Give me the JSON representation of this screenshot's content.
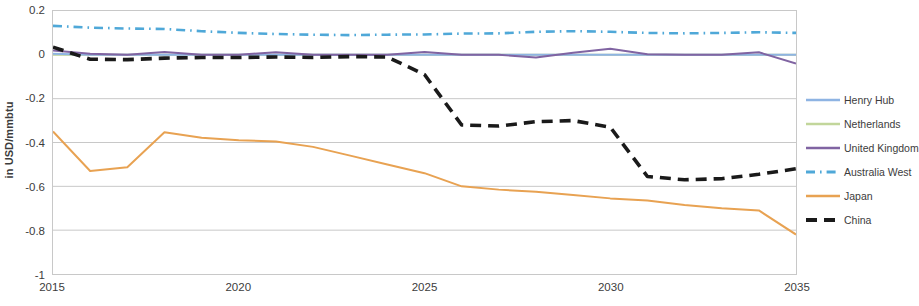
{
  "chart_data": {
    "type": "line",
    "title": "",
    "xlabel": "",
    "ylabel": "in USD/mmbtu",
    "xlim": [
      2015,
      2035
    ],
    "ylim": [
      -1,
      0.2
    ],
    "yticks": [
      0.2,
      0,
      -0.2,
      -0.4,
      -0.6,
      -0.8,
      -1
    ],
    "ytick_labels": [
      "0.2",
      "0",
      "-0.2",
      "-0.4",
      "-0.6",
      "-0.8",
      "-1"
    ],
    "xticks": [
      2015,
      2020,
      2025,
      2030,
      2035
    ],
    "xtick_labels": [
      "2015",
      "2020",
      "2025",
      "2030",
      "2035"
    ],
    "grid": "horizontal",
    "legend_position": "right",
    "x": [
      2015,
      2016,
      2017,
      2018,
      2019,
      2020,
      2021,
      2022,
      2023,
      2024,
      2025,
      2026,
      2027,
      2028,
      2029,
      2030,
      2031,
      2032,
      2033,
      2034,
      2035
    ],
    "series": [
      {
        "name": "Henry Hub",
        "color": "#8EB4E3",
        "style": "solid",
        "values": [
          0.005,
          0.0,
          0.0,
          0.0,
          0.0,
          0.0,
          0.0,
          0.0,
          0.0,
          0.0,
          0.0,
          0.0,
          0.0,
          0.0,
          0.0,
          0.0,
          0.0,
          0.0,
          0.0,
          0.0,
          0.0
        ]
      },
      {
        "name": "Netherlands",
        "color": "#C2D69B",
        "style": "solid",
        "values": [
          0.0,
          0.0,
          0.0,
          0.0,
          0.0,
          0.0,
          0.0,
          0.0,
          0.0,
          0.0,
          0.0,
          0.0,
          0.0,
          0.0,
          0.0,
          0.0,
          0.0,
          0.0,
          0.0,
          0.0,
          0.0
        ]
      },
      {
        "name": "United Kingdom",
        "color": "#8064A2",
        "style": "solid",
        "values": [
          0.02,
          0.005,
          0.0,
          0.013,
          0.0,
          0.0,
          0.012,
          0.0,
          0.0,
          0.0,
          0.013,
          0.0,
          0.0,
          -0.012,
          0.01,
          0.028,
          0.003,
          0.0,
          0.0,
          0.012,
          -0.04
        ]
      },
      {
        "name": "Australia West",
        "color": "#4FA8D8",
        "style": "dash-dot",
        "values": [
          0.132,
          0.124,
          0.12,
          0.118,
          0.108,
          0.1,
          0.095,
          0.092,
          0.09,
          0.092,
          0.093,
          0.097,
          0.098,
          0.105,
          0.108,
          0.105,
          0.1,
          0.098,
          0.1,
          0.103,
          0.1
        ]
      },
      {
        "name": "Japan",
        "color": "#E8A252",
        "style": "solid",
        "values": [
          -0.35,
          -0.53,
          -0.513,
          -0.353,
          -0.378,
          -0.39,
          -0.395,
          -0.42,
          -0.46,
          -0.5,
          -0.54,
          -0.6,
          -0.615,
          -0.625,
          -0.64,
          -0.655,
          -0.665,
          -0.685,
          -0.7,
          -0.71,
          -0.82
        ]
      },
      {
        "name": "China",
        "color": "#1a1a1a",
        "style": "dashed",
        "values": [
          0.035,
          -0.02,
          -0.022,
          -0.015,
          -0.012,
          -0.012,
          -0.01,
          -0.012,
          -0.008,
          -0.01,
          -0.09,
          -0.32,
          -0.325,
          -0.305,
          -0.3,
          -0.33,
          -0.555,
          -0.57,
          -0.565,
          -0.545,
          -0.52
        ]
      }
    ]
  },
  "legend": {
    "items": [
      {
        "label": "Henry Hub"
      },
      {
        "label": "Netherlands"
      },
      {
        "label": "United Kingdom"
      },
      {
        "label": "Australia West"
      },
      {
        "label": "Japan"
      },
      {
        "label": "China"
      }
    ]
  }
}
